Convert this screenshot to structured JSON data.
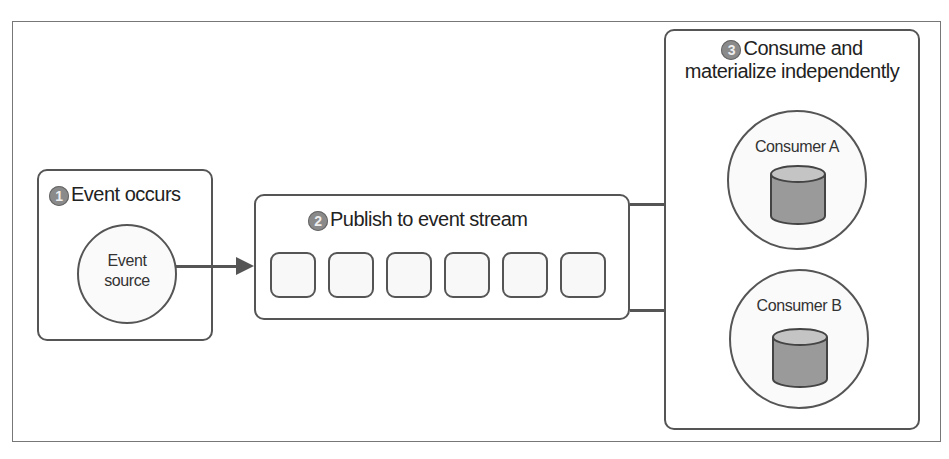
{
  "diagram": {
    "steps": [
      {
        "number": "1",
        "title": "Event occurs"
      },
      {
        "number": "2",
        "title": "Publish to event stream"
      },
      {
        "number": "3",
        "title_line1": "Consume and",
        "title_line2": "materialize independently"
      }
    ],
    "event_source": {
      "line1": "Event",
      "line2": "source"
    },
    "stream_slots": 6,
    "consumers": [
      {
        "label": "Consumer A"
      },
      {
        "label": "Consumer B"
      }
    ],
    "colors": {
      "stroke": "#555555",
      "badge": "#8a8a8a",
      "db_fill": "#9a9a9a",
      "db_top": "#c4c4c4"
    }
  }
}
